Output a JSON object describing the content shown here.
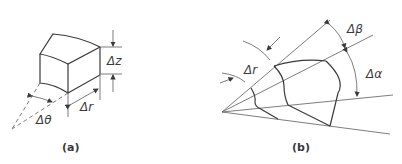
{
  "figure_a": {
    "caption": "(a)",
    "labels": {
      "dz": "Δz",
      "dr": "Δr",
      "dtheta": "Δθ"
    }
  },
  "figure_b": {
    "caption": "(b)",
    "labels": {
      "dr": "Δr",
      "dbeta": "Δβ",
      "dalpha": "Δα"
    }
  },
  "colors": {
    "line": "#6e6e6e",
    "edge": "#3a3a3a",
    "background": "#ffffff"
  }
}
